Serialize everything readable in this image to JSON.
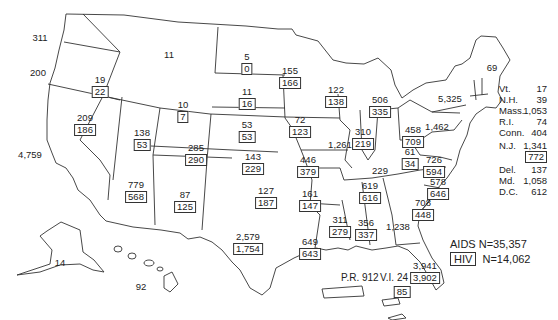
{
  "map": {
    "legend": {
      "aids_label": "AIDS",
      "aids_total": "N=35,357",
      "hiv_label": "HIV",
      "hiv_total": "N=14,062"
    },
    "states": [
      {
        "id": "WA",
        "aids": "311",
        "x": 40,
        "y": 33
      },
      {
        "id": "OR",
        "aids": "200",
        "x": 38,
        "y": 68
      },
      {
        "id": "CA",
        "aids": "4,759",
        "x": 30,
        "y": 150
      },
      {
        "id": "ID",
        "aids": "19",
        "hiv": "22",
        "x": 100,
        "y": 75
      },
      {
        "id": "MT",
        "aids": "11",
        "x": 169,
        "y": 50
      },
      {
        "id": "NV",
        "aids": "209",
        "hiv": "186",
        "x": 85,
        "y": 113
      },
      {
        "id": "UT",
        "aids": "138",
        "hiv": "53",
        "x": 142,
        "y": 128
      },
      {
        "id": "WY",
        "aids": "10",
        "hiv": "7",
        "x": 183,
        "y": 100
      },
      {
        "id": "CO",
        "aids": "285",
        "hiv": "290",
        "x": 196,
        "y": 143
      },
      {
        "id": "AZ",
        "aids": "779",
        "hiv": "568",
        "x": 136,
        "y": 180
      },
      {
        "id": "NM",
        "aids": "87",
        "hiv": "125",
        "x": 185,
        "y": 190
      },
      {
        "id": "ND",
        "aids": "5",
        "hiv": "0",
        "x": 247,
        "y": 52
      },
      {
        "id": "SD",
        "aids": "11",
        "hiv": "16",
        "x": 247,
        "y": 87
      },
      {
        "id": "NE",
        "aids": "53",
        "hiv": "53",
        "x": 247,
        "y": 120
      },
      {
        "id": "KS",
        "aids": "143",
        "hiv": "229",
        "x": 253,
        "y": 152
      },
      {
        "id": "OK",
        "aids": "127",
        "hiv": "187",
        "x": 266,
        "y": 186
      },
      {
        "id": "TX",
        "aids": "2,579",
        "hiv": "1,754",
        "x": 248,
        "y": 232
      },
      {
        "id": "MN",
        "aids": "155",
        "hiv": "166",
        "x": 290,
        "y": 66
      },
      {
        "id": "IA",
        "aids": "72",
        "hiv": "123",
        "x": 300,
        "y": 115
      },
      {
        "id": "MO",
        "aids": "446",
        "hiv": "379",
        "x": 308,
        "y": 155
      },
      {
        "id": "AR",
        "aids": "161",
        "hiv": "147",
        "x": 310,
        "y": 189
      },
      {
        "id": "LA",
        "aids": "649",
        "hiv": "643",
        "x": 310,
        "y": 237
      },
      {
        "id": "WI",
        "aids": "122",
        "hiv": "138",
        "x": 336,
        "y": 85
      },
      {
        "id": "IL",
        "aids": "1,261",
        "x": 340,
        "y": 140
      },
      {
        "id": "MI",
        "aids": "506",
        "hiv": "335",
        "x": 380,
        "y": 95
      },
      {
        "id": "IN",
        "aids": "310",
        "hiv": "219",
        "x": 363,
        "y": 127
      },
      {
        "id": "OH",
        "aids": "458",
        "hiv": "709",
        "x": 413,
        "y": 125
      },
      {
        "id": "KY",
        "aids": "229",
        "x": 380,
        "y": 166
      },
      {
        "id": "TN",
        "aids": "619",
        "hiv": "616",
        "x": 370,
        "y": 181
      },
      {
        "id": "MS",
        "aids": "311",
        "hiv": "279",
        "x": 340,
        "y": 215
      },
      {
        "id": "AL",
        "aids": "356",
        "hiv": "337",
        "x": 366,
        "y": 218
      },
      {
        "id": "GA",
        "aids": "1,238",
        "x": 398,
        "y": 222
      },
      {
        "id": "FL",
        "aids": "3,941",
        "hiv": "3,902",
        "x": 425,
        "y": 261
      },
      {
        "id": "SC",
        "aids": "708",
        "hiv": "448",
        "x": 423,
        "y": 198
      },
      {
        "id": "NC",
        "aids": "578",
        "hiv": "646",
        "x": 438,
        "y": 177
      },
      {
        "id": "VA",
        "aids": "726",
        "hiv": "594",
        "x": 434,
        "y": 155
      },
      {
        "id": "WV",
        "aids": "61",
        "hiv": "34",
        "x": 410,
        "y": 147
      },
      {
        "id": "PA",
        "aids": "1,462",
        "x": 437,
        "y": 122
      },
      {
        "id": "NY",
        "aids": "5,325",
        "x": 450,
        "y": 94
      },
      {
        "id": "ME",
        "aids": "69",
        "x": 492,
        "y": 63
      },
      {
        "id": "AK",
        "aids": "14",
        "x": 60,
        "y": 258
      },
      {
        "id": "HI",
        "aids": "92",
        "x": 141,
        "y": 282
      }
    ],
    "territories": [
      {
        "id": "PR",
        "label": "P.R.",
        "aids": "912"
      },
      {
        "id": "VI",
        "label": "V.I.",
        "aids": "24",
        "hiv": "85"
      }
    ],
    "northeast_list": [
      {
        "name": "Vt.",
        "aids": "17"
      },
      {
        "name": "N.H.",
        "aids": "39"
      },
      {
        "name": "Mass.",
        "aids": "1,053"
      },
      {
        "name": "R.I.",
        "aids": "74"
      },
      {
        "name": "Conn.",
        "aids": "404"
      },
      {
        "name": "N.J.",
        "aids": "1,341",
        "hiv": "772"
      },
      {
        "name": "Del.",
        "aids": "137"
      },
      {
        "name": "Md.",
        "aids": "1,058"
      },
      {
        "name": "D.C.",
        "aids": "612"
      }
    ]
  }
}
